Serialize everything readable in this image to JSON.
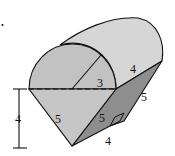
{
  "figure": {
    "colors": {
      "background": "#ffffff",
      "front_face": "#c4c4c4",
      "top_surface": "#d4d4d4",
      "side_face": "#8e8e8e",
      "stroke": "#111111"
    },
    "labels": {
      "radius": "3",
      "cylinder_length": "4",
      "right_slant": "5",
      "front_slant": "5",
      "inner_slant": "5",
      "bottom_length": "4",
      "height": "4"
    }
  }
}
